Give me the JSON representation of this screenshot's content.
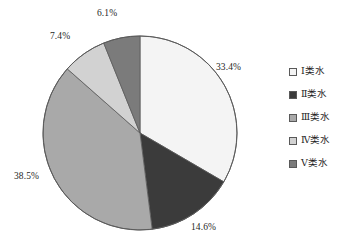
{
  "chart_data": {
    "type": "pie",
    "title": "",
    "subtitle": "",
    "xlabel": "",
    "ylabel": "",
    "grid": false,
    "legend_position": "right",
    "unit": "%",
    "categories": [
      "Ⅰ类水",
      "Ⅱ类水",
      "Ⅲ类水",
      "Ⅳ类水",
      "Ⅴ类水"
    ],
    "values": [
      33.4,
      14.6,
      38.5,
      7.4,
      6.1
    ],
    "data_labels": [
      "33.4%",
      "14.6%",
      "38.5%",
      "7.4%",
      "6.1%"
    ],
    "colors": [
      "#f4f4f4",
      "#3b3b3b",
      "#a9a9a9",
      "#d2d2d2",
      "#7b7b7b"
    ],
    "start_angle_deg": 0,
    "direction": "clockwise",
    "slices": [
      {
        "label": "Ⅰ类水",
        "value": 33.4,
        "data_label": "33.4%",
        "color": "#f4f4f4"
      },
      {
        "label": "Ⅱ类水",
        "value": 14.6,
        "data_label": "14.6%",
        "color": "#3b3b3b"
      },
      {
        "label": "Ⅲ类水",
        "value": 38.5,
        "data_label": "38.5%",
        "color": "#a9a9a9"
      },
      {
        "label": "Ⅳ类水",
        "value": 7.4,
        "data_label": "7.4%",
        "color": "#d2d2d2"
      },
      {
        "label": "Ⅴ类水",
        "value": 6.1,
        "data_label": "6.1%",
        "color": "#7b7b7b"
      }
    ]
  },
  "legend": {
    "items": [
      {
        "label": "Ⅰ类水",
        "color": "#f4f4f4"
      },
      {
        "label": "Ⅱ类水",
        "color": "#3b3b3b"
      },
      {
        "label": "Ⅲ类水",
        "color": "#a9a9a9"
      },
      {
        "label": "Ⅳ类水",
        "color": "#d2d2d2"
      },
      {
        "label": "Ⅴ类水",
        "color": "#7b7b7b"
      }
    ]
  },
  "style": {
    "background": "#ffffff",
    "outline": "#5a5a5a",
    "text": "#1f1f1f"
  }
}
